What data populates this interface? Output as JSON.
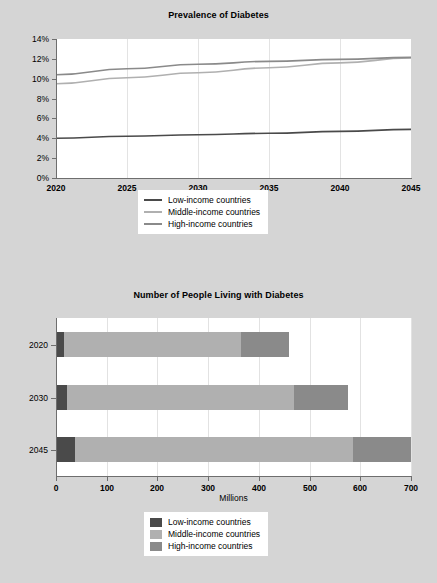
{
  "series_colors": {
    "low": "#4a4a4a",
    "middle": "#b0b0b0",
    "high": "#8a8a8a"
  },
  "background": "#d5d5d5",
  "plot_background": "#ffffff",
  "line_chart": {
    "title": "Prevalence of Diabetes",
    "legend": {
      "items": [
        {
          "label": "Low-income countries",
          "color": "#4a4a4a"
        },
        {
          "label": "Middle-income countries",
          "color": "#b0b0b0"
        },
        {
          "label": "High-income countries",
          "color": "#8a8a8a"
        }
      ]
    }
  },
  "bar_chart": {
    "title": "Number of People Living with Diabetes",
    "xlabel": "Millions",
    "legend": {
      "items": [
        {
          "label": "Low-income countries",
          "color": "#4a4a4a"
        },
        {
          "label": "Middle-income countries",
          "color": "#b0b0b0"
        },
        {
          "label": "High-income countries",
          "color": "#8a8a8a"
        }
      ]
    }
  },
  "chart_data": [
    {
      "type": "line",
      "title": "Prevalence of Diabetes",
      "xlabel": "",
      "ylabel": "",
      "x": [
        2020,
        2025,
        2030,
        2035,
        2040,
        2045
      ],
      "xlim": [
        2020,
        2045
      ],
      "ylim": [
        0,
        14
      ],
      "xticks": [
        2020,
        2025,
        2030,
        2035,
        2040,
        2045
      ],
      "xtick_labels": [
        "2020",
        "2025",
        "2030",
        "2035",
        "2040",
        "2045"
      ],
      "yticks": [
        0,
        2,
        4,
        6,
        8,
        10,
        12,
        14
      ],
      "ytick_labels": [
        "0%",
        "2%",
        "4%",
        "6%",
        "8%",
        "10%",
        "12%",
        "14%"
      ],
      "grid": "vertical",
      "legend_position": "below",
      "series": [
        {
          "name": "Low-income countries",
          "color": "#4a4a4a",
          "values": [
            4.0,
            4.2,
            4.35,
            4.5,
            4.7,
            4.9
          ]
        },
        {
          "name": "Middle-income countries",
          "color": "#b0b0b0",
          "values": [
            9.5,
            10.1,
            10.6,
            11.1,
            11.6,
            12.1
          ]
        },
        {
          "name": "High-income countries",
          "color": "#8a8a8a",
          "values": [
            10.4,
            11.0,
            11.45,
            11.75,
            11.95,
            12.15
          ]
        }
      ]
    },
    {
      "type": "bar",
      "orientation": "horizontal",
      "stacked": true,
      "title": "Number of People Living with Diabetes",
      "xlabel": "Millions",
      "ylabel": "",
      "categories": [
        "2020",
        "2030",
        "2045"
      ],
      "xlim": [
        0,
        700
      ],
      "xticks": [
        0,
        100,
        200,
        300,
        400,
        500,
        600,
        700
      ],
      "xtick_labels": [
        "0",
        "100",
        "200",
        "300",
        "400",
        "500",
        "600",
        "700"
      ],
      "grid": "vertical",
      "legend_position": "below",
      "series": [
        {
          "name": "Low-income countries",
          "color": "#4a4a4a",
          "values": [
            15,
            22,
            37
          ]
        },
        {
          "name": "Middle-income countries",
          "color": "#b0b0b0",
          "values": [
            350,
            448,
            548
          ]
        },
        {
          "name": "High-income countries",
          "color": "#8a8a8a",
          "values": [
            95,
            105,
            115
          ]
        }
      ],
      "totals": [
        460,
        575,
        700
      ]
    }
  ]
}
